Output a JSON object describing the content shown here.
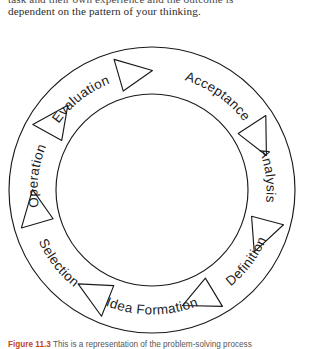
{
  "page": {
    "width": 313,
    "height": 349,
    "background": "#ffffff"
  },
  "body_text": {
    "clipped_line": "task and their own experience and the outcome is",
    "line_1": "dependent on the pattern of your thinking."
  },
  "diagram": {
    "name": "creative-thinking-cycle",
    "type": "circular-cycle",
    "center": {
      "x": 152,
      "y": 152
    },
    "outer_radius": 143,
    "inner_radius": 96,
    "stroke_color": "#1a1a1a",
    "fill_color": "#ffffff",
    "direction": "clockwise",
    "arrow_glyph": "chevron-right",
    "segments": [
      {
        "label": "Acceptance",
        "angle_deg": 35
      },
      {
        "label": "Analysis",
        "angle_deg": 83
      },
      {
        "label": "Definition",
        "angle_deg": 127
      },
      {
        "label": "Idea Formation",
        "angle_deg": 180
      },
      {
        "label": "Selection",
        "angle_deg": 232
      },
      {
        "label": "Operation",
        "angle_deg": 277
      },
      {
        "label": "Evaluation",
        "angle_deg": 322
      }
    ]
  },
  "caption": {
    "figure_number": "Figure 11.3",
    "text": "This is a representation of the problem-solving process"
  }
}
